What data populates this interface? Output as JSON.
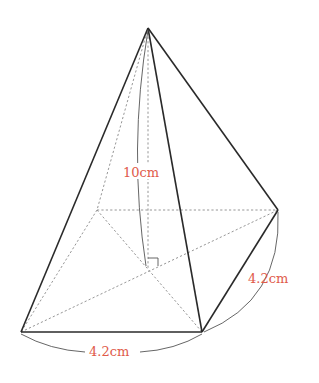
{
  "figure": {
    "type": "square pyramid",
    "labels": {
      "height": "10cm",
      "base_right_edge": "4.2cm",
      "base_front_edge": "4.2cm"
    },
    "colors": {
      "edge": "#2a2a2a",
      "hidden_edge": "#8a8a8a",
      "label": "#e05a4a"
    },
    "vertices": {
      "apex": [
        148,
        28
      ],
      "front_left": [
        21,
        332
      ],
      "front_right": [
        202,
        332
      ],
      "back_right": [
        278,
        210
      ],
      "back_left": [
        97,
        210
      ],
      "center_foot": [
        148,
        268
      ]
    }
  }
}
